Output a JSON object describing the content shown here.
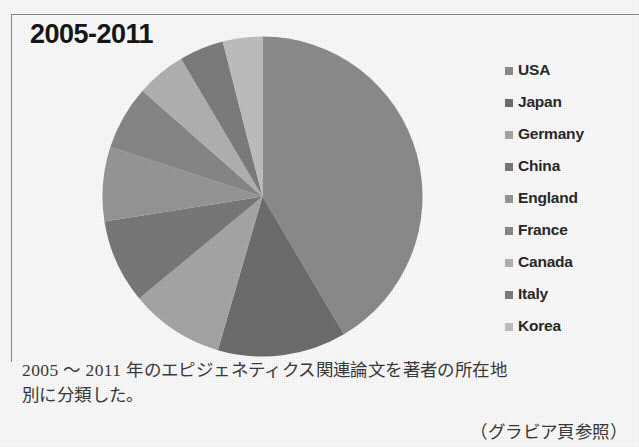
{
  "figure": {
    "title": "2005-2011",
    "caption_line_1": "2005 ～ 2011 年のエピジェネティクス関連論文を著者の所在地",
    "caption_line_2": "別に分類した。",
    "source_note": "（グラビア頁参照）"
  },
  "chart_data": {
    "type": "pie",
    "title": "2005-2011",
    "xlabel": "",
    "ylabel": "",
    "legend_position": "right",
    "grid": false,
    "start_angle_deg": 0,
    "direction": "clockwise",
    "categories": [
      "USA",
      "Japan",
      "Germany",
      "China",
      "England",
      "France",
      "Canada",
      "Italy",
      "Korea"
    ],
    "values": [
      41.5,
      13.0,
      9.5,
      8.5,
      7.5,
      6.5,
      5.0,
      4.5,
      4.0
    ],
    "units": "percent",
    "colors": [
      "#8e8e8e",
      "#6f6f6f",
      "#a9a9a9",
      "#7b7b7b",
      "#999999",
      "#8a8a8a",
      "#b5b5b5",
      "#7f7f7f",
      "#c2c2c2"
    ],
    "legend": [
      {
        "label": "USA",
        "color": "#8e8e8e",
        "value": 41.5
      },
      {
        "label": "Japan",
        "color": "#6f6f6f",
        "value": 13.0
      },
      {
        "label": "Germany",
        "color": "#a9a9a9",
        "value": 9.5
      },
      {
        "label": "China",
        "color": "#7b7b7b",
        "value": 8.5
      },
      {
        "label": "England",
        "color": "#999999",
        "value": 7.5
      },
      {
        "label": "France",
        "color": "#8a8a8a",
        "value": 6.5
      },
      {
        "label": "Canada",
        "color": "#b5b5b5",
        "value": 5.0
      },
      {
        "label": "Italy",
        "color": "#7f7f7f",
        "value": 4.5
      },
      {
        "label": "Korea",
        "color": "#c2c2c2",
        "value": 4.0
      }
    ]
  }
}
